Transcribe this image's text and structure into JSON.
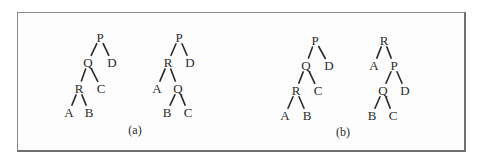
{
  "figure": {
    "panels": [
      {
        "id": "a",
        "caption": "(a)",
        "caption_pos": [
          135,
          130
        ],
        "trees": [
          {
            "nodes": [
              {
                "id": "P",
                "label": "P",
                "x": 100,
                "y": 37
              },
              {
                "id": "Q",
                "label": "Q",
                "x": 88,
                "y": 62
              },
              {
                "id": "D",
                "label": "D",
                "x": 112,
                "y": 62
              },
              {
                "id": "R",
                "label": "R",
                "x": 79,
                "y": 88
              },
              {
                "id": "C",
                "label": "C",
                "x": 101,
                "y": 88
              },
              {
                "id": "A",
                "label": "A",
                "x": 69,
                "y": 112
              },
              {
                "id": "B",
                "label": "B",
                "x": 89,
                "y": 112
              }
            ],
            "edges": [
              [
                "P",
                "Q"
              ],
              [
                "P",
                "D"
              ],
              [
                "Q",
                "R"
              ],
              [
                "Q",
                "C"
              ],
              [
                "R",
                "A"
              ],
              [
                "R",
                "B"
              ]
            ]
          },
          {
            "nodes": [
              {
                "id": "P",
                "label": "P",
                "x": 179,
                "y": 37
              },
              {
                "id": "R",
                "label": "R",
                "x": 168,
                "y": 62
              },
              {
                "id": "D",
                "label": "D",
                "x": 190,
                "y": 62
              },
              {
                "id": "A",
                "label": "A",
                "x": 157,
                "y": 88
              },
              {
                "id": "Q",
                "label": "Q",
                "x": 178,
                "y": 88
              },
              {
                "id": "B",
                "label": "B",
                "x": 167,
                "y": 112
              },
              {
                "id": "C",
                "label": "C",
                "x": 188,
                "y": 112
              }
            ],
            "edges": [
              [
                "P",
                "R"
              ],
              [
                "P",
                "D"
              ],
              [
                "R",
                "A"
              ],
              [
                "R",
                "Q"
              ],
              [
                "Q",
                "B"
              ],
              [
                "Q",
                "C"
              ]
            ]
          }
        ]
      },
      {
        "id": "b",
        "caption": "(b)",
        "caption_pos": [
          343,
          132
        ],
        "trees": [
          {
            "nodes": [
              {
                "id": "P",
                "label": "P",
                "x": 315,
                "y": 40
              },
              {
                "id": "Q",
                "label": "Q",
                "x": 306,
                "y": 65
              },
              {
                "id": "D",
                "label": "D",
                "x": 329,
                "y": 65
              },
              {
                "id": "R",
                "label": "R",
                "x": 296,
                "y": 90
              },
              {
                "id": "C",
                "label": "C",
                "x": 318,
                "y": 90
              },
              {
                "id": "A",
                "label": "A",
                "x": 285,
                "y": 115
              },
              {
                "id": "B",
                "label": "B",
                "x": 307,
                "y": 115
              }
            ],
            "edges": [
              [
                "P",
                "Q"
              ],
              [
                "P",
                "D"
              ],
              [
                "Q",
                "R"
              ],
              [
                "Q",
                "C"
              ],
              [
                "R",
                "A"
              ],
              [
                "R",
                "B"
              ]
            ]
          },
          {
            "nodes": [
              {
                "id": "R",
                "label": "R",
                "x": 384,
                "y": 40
              },
              {
                "id": "A",
                "label": "A",
                "x": 374,
                "y": 65
              },
              {
                "id": "P",
                "label": "P",
                "x": 394,
                "y": 65
              },
              {
                "id": "Q",
                "label": "Q",
                "x": 383,
                "y": 90
              },
              {
                "id": "D",
                "label": "D",
                "x": 405,
                "y": 90
              },
              {
                "id": "B",
                "label": "B",
                "x": 372,
                "y": 115
              },
              {
                "id": "C",
                "label": "C",
                "x": 393,
                "y": 115
              }
            ],
            "edges": [
              [
                "R",
                "A"
              ],
              [
                "R",
                "P"
              ],
              [
                "P",
                "Q"
              ],
              [
                "P",
                "D"
              ],
              [
                "Q",
                "B"
              ],
              [
                "Q",
                "C"
              ]
            ]
          }
        ]
      }
    ]
  }
}
